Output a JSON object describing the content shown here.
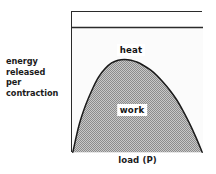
{
  "figure": {
    "name": "energy-released-per-contraction-vs-load",
    "y_axis_label_lines": [
      "energy",
      "released",
      "per",
      "contraction"
    ],
    "x_axis_label": "load (P)",
    "region_labels": {
      "upper": "heat",
      "lower": "work"
    },
    "colors": {
      "frame": "#2b2b2b",
      "curve": "#1a1a1a",
      "work_fill": "#a9a9a9",
      "heat_fill": "#fdfdfd",
      "background": "#ffffff",
      "text": "#1b1b1b"
    }
  },
  "chart_data": {
    "type": "area",
    "title": "",
    "subtitle": "",
    "xlabel": "load (P)",
    "ylabel": "energy released per contraction",
    "grid": false,
    "legend_position": "inline-annotations",
    "axis_ticks": {
      "x": [],
      "y": []
    },
    "xlim": [
      0,
      1
    ],
    "ylim": [
      0,
      1
    ],
    "annotations": [
      {
        "text": "heat",
        "x": 0.45,
        "y": 0.78,
        "note": "region between total-energy ceiling line and work curve"
      },
      {
        "text": "work",
        "x": 0.46,
        "y": 0.35,
        "note": "shaded region under the work curve"
      }
    ],
    "series": [
      {
        "name": "total energy released (ceiling)",
        "type": "line",
        "x": [
          0,
          1
        ],
        "values": [
          0.895,
          0.895
        ]
      },
      {
        "name": "work",
        "type": "area",
        "fill": "#a9a9a9",
        "x": [
          0.0,
          0.05,
          0.1,
          0.15,
          0.2,
          0.25,
          0.3,
          0.35,
          0.4,
          0.45,
          0.5,
          0.55,
          0.6,
          0.65,
          0.7,
          0.75,
          0.8,
          0.85,
          0.9,
          0.95,
          1.0
        ],
        "values": [
          0.0,
          0.2,
          0.34,
          0.45,
          0.54,
          0.6,
          0.64,
          0.66,
          0.665,
          0.66,
          0.645,
          0.62,
          0.59,
          0.55,
          0.5,
          0.445,
          0.38,
          0.3,
          0.21,
          0.11,
          0.0
        ]
      }
    ]
  }
}
